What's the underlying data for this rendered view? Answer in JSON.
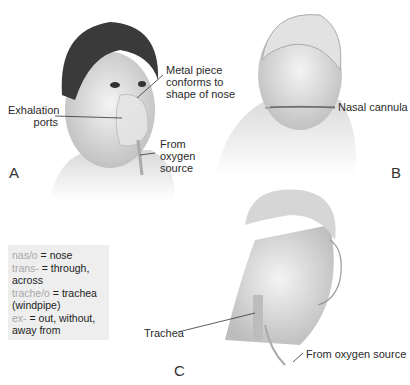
{
  "figure": {
    "panels": [
      {
        "letter": "A",
        "device": "oxygen face mask",
        "labels": {
          "metal_piece": [
            "Metal piece",
            "conforms to",
            "shape of nose"
          ],
          "exhalation": [
            "Exhalation",
            "ports"
          ],
          "from_oxygen": [
            "From",
            "oxygen",
            "source"
          ]
        }
      },
      {
        "letter": "B",
        "device": "nasal cannula",
        "labels": {
          "nasal_cannula": "Nasal cannula"
        }
      },
      {
        "letter": "C",
        "device": "transtracheal oxygen",
        "labels": {
          "trachea": "Trachea",
          "from_oxygen": "From oxygen source"
        }
      }
    ],
    "glossary": [
      {
        "root": "nas/o",
        "def": " = nose"
      },
      {
        "root": "trans-",
        "def": " = through, across"
      },
      {
        "root": "trache/o",
        "def": " = trachea (windpipe)"
      },
      {
        "root": "ex-",
        "def": " = out, without, away from"
      }
    ]
  },
  "colors": {
    "glossary_bg": "#eeeeee",
    "root_text": "#a9a9a9"
  }
}
